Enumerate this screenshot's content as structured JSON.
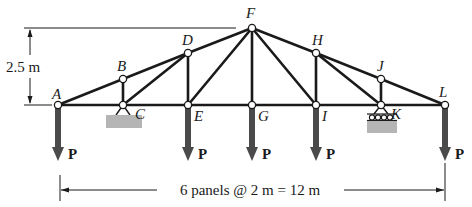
{
  "diagram": {
    "type": "roof truss",
    "colors": {
      "member": "#1a1a1a",
      "load_arrow": "#4a4a4a",
      "ground_hatch": "#b5b5b5",
      "node_fill": "#ffffff"
    },
    "nodes": [
      {
        "id": "A",
        "label": "A",
        "x": 58,
        "y": 105
      },
      {
        "id": "B",
        "label": "B",
        "x": 123,
        "y": 79
      },
      {
        "id": "C",
        "label": "C",
        "x": 123,
        "y": 105
      },
      {
        "id": "D",
        "label": "D",
        "x": 188,
        "y": 53
      },
      {
        "id": "E",
        "label": "E",
        "x": 188,
        "y": 105
      },
      {
        "id": "F",
        "label": "F",
        "x": 252,
        "y": 28
      },
      {
        "id": "G",
        "label": "G",
        "x": 252,
        "y": 105
      },
      {
        "id": "H",
        "label": "H",
        "x": 316,
        "y": 53
      },
      {
        "id": "I",
        "label": "I",
        "x": 316,
        "y": 105
      },
      {
        "id": "J",
        "label": "J",
        "x": 381,
        "y": 79
      },
      {
        "id": "K",
        "label": "K",
        "x": 381,
        "y": 105
      },
      {
        "id": "L",
        "label": "L",
        "x": 445,
        "y": 105
      }
    ],
    "members": [
      [
        "A",
        "C"
      ],
      [
        "C",
        "E"
      ],
      [
        "E",
        "G"
      ],
      [
        "G",
        "I"
      ],
      [
        "I",
        "K"
      ],
      [
        "K",
        "L"
      ],
      [
        "A",
        "B"
      ],
      [
        "B",
        "D"
      ],
      [
        "D",
        "F"
      ],
      [
        "F",
        "H"
      ],
      [
        "H",
        "J"
      ],
      [
        "J",
        "L"
      ],
      [
        "B",
        "C"
      ],
      [
        "C",
        "D"
      ],
      [
        "D",
        "E"
      ],
      [
        "E",
        "F"
      ],
      [
        "F",
        "G"
      ],
      [
        "F",
        "I"
      ],
      [
        "H",
        "I"
      ],
      [
        "H",
        "K"
      ],
      [
        "J",
        "K"
      ]
    ],
    "supports": [
      {
        "node": "C",
        "type": "pin"
      },
      {
        "node": "K",
        "type": "roller"
      }
    ],
    "loads": [
      {
        "node": "A",
        "label": "P"
      },
      {
        "node": "E",
        "label": "P"
      },
      {
        "node": "G",
        "label": "P"
      },
      {
        "node": "I",
        "label": "P"
      },
      {
        "node": "L",
        "label": "P"
      }
    ],
    "dimensions": {
      "height_label": "2.5 m",
      "span_label": "6 panels @ 2 m = 12 m"
    }
  }
}
